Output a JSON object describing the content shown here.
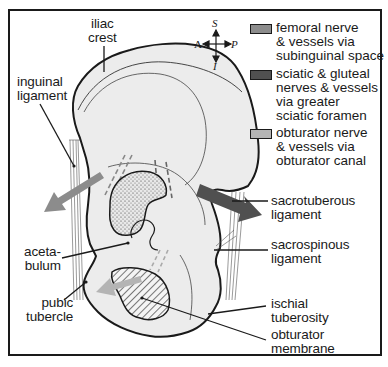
{
  "diagram": {
    "labels": {
      "iliac_crest": "iliac\ncrest",
      "inguinal_ligament": "inguinal\nligament",
      "acetabulum": "aceta-\nbulum",
      "pubic_tubercle": "pubic\ntubercle",
      "sacrotuberous_ligament": "sacrotuberous\nligament",
      "sacrospinous_ligament": "sacrospinous\nligament",
      "ischial_tuberosity": "ischial\ntuberosity",
      "obturator_membrane": "obturator\nmembrane"
    },
    "compass": {
      "up": "S",
      "down": "I",
      "left": "A",
      "right": "P"
    },
    "legend": [
      {
        "label": "femoral nerve\n& vessels via\nsubinguinal space",
        "color": "#8c8c8c"
      },
      {
        "label": "sciatic & gluteal\nnerves & vessels\nvia greater\nsciatic foramen",
        "color": "#505050"
      },
      {
        "label": "obturator nerve\n& vessels via\nobturator canal",
        "color": "#b4b4b4"
      }
    ],
    "colors": {
      "bone_fill": "#ececec",
      "outline": "#1a1a1a",
      "femoral_arrow": "#8c8c8c",
      "sciatic_arrow": "#505050",
      "obturator_arrow": "#b4b4b4"
    }
  }
}
